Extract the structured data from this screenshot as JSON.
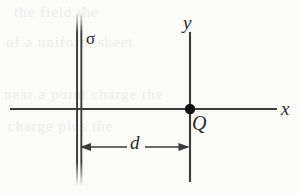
{
  "figure": {
    "background_color": "#fbfbfa",
    "ink_color": "#3a3a3a",
    "labels": {
      "sheet_charge_density": "σ",
      "y_axis": "y",
      "x_axis": "x",
      "point_charge": "Q",
      "distance": "d"
    },
    "elements": {
      "sheet": {
        "name": "charged-sheet",
        "orientation": "vertical",
        "x": 77,
        "top": 12,
        "bottom": 186,
        "line_count": 2,
        "line_gap": 4
      },
      "x_axis": {
        "name": "x-axis",
        "y": 109,
        "start_x": 10,
        "end_x": 277
      },
      "y_axis": {
        "name": "y-axis",
        "x": 190,
        "start_y": 32,
        "end_y": 182
      },
      "charge_dot": {
        "name": "point-charge-dot",
        "cx": 190,
        "cy": 109,
        "r": 5.2,
        "color": "#111111"
      },
      "dimension_arrow": {
        "name": "distance-dimension",
        "y": 147,
        "from_x": 80,
        "to_x": 189,
        "double_headed": true
      }
    },
    "ghost_text": [
      "the field the",
      "of a uniform sheet",
      "near a point charge the",
      "charge plus the"
    ]
  }
}
